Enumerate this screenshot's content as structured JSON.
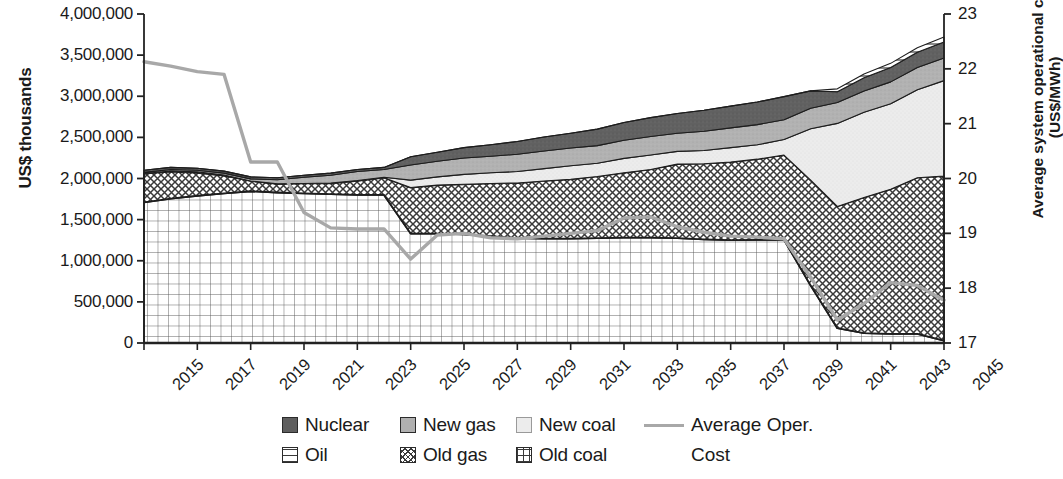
{
  "chart_data": {
    "type": "area",
    "title": "",
    "xlabel": "",
    "ylabel": "US$ thousands",
    "y2label": "Average system operational cost (US$/MWh)",
    "grid": false,
    "legend_position": "bottom",
    "x": [
      2015,
      2016,
      2017,
      2018,
      2019,
      2020,
      2021,
      2022,
      2023,
      2024,
      2025,
      2026,
      2027,
      2028,
      2029,
      2030,
      2031,
      2032,
      2033,
      2034,
      2035,
      2036,
      2037,
      2038,
      2039,
      2040,
      2041,
      2042,
      2043,
      2044,
      2045
    ],
    "xtick_labels": [
      "2015",
      "2017",
      "2019",
      "2021",
      "2023",
      "2025",
      "2027",
      "2029",
      "2031",
      "2033",
      "2035",
      "2037",
      "2039",
      "2041",
      "2043",
      "2045"
    ],
    "ylim": [
      0,
      4000000
    ],
    "ytick_labels": [
      "0",
      "500,000",
      "1,000,000",
      "1,500,000",
      "2,000,000",
      "2,500,000",
      "3,000,000",
      "3,500,000",
      "4,000,000"
    ],
    "ytick_values": [
      0,
      500000,
      1000000,
      1500000,
      2000000,
      2500000,
      3000000,
      3500000,
      4000000
    ],
    "y2lim": [
      17,
      23
    ],
    "y2tick_labels": [
      "17",
      "18",
      "19",
      "20",
      "21",
      "22",
      "23"
    ],
    "y2tick_values": [
      17,
      18,
      19,
      20,
      21,
      22,
      23
    ],
    "stack_order": [
      "Old coal",
      "Old gas",
      "New coal",
      "New gas",
      "Nuclear",
      "Oil"
    ],
    "series": [
      {
        "name": "Old coal",
        "pattern": "grid",
        "fill": "#ffffff",
        "values": [
          1710000,
          1755000,
          1790000,
          1820000,
          1845000,
          1830000,
          1820000,
          1810000,
          1800000,
          1800000,
          1330000,
          1330000,
          1320000,
          1300000,
          1275000,
          1270000,
          1270000,
          1275000,
          1280000,
          1280000,
          1275000,
          1260000,
          1250000,
          1255000,
          1255000,
          700000,
          180000,
          120000,
          110000,
          110000,
          30000
        ]
      },
      {
        "name": "Old gas",
        "pattern": "crosshatch",
        "fill": "#ffffff",
        "values": [
          350000,
          330000,
          280000,
          215000,
          125000,
          105000,
          120000,
          130000,
          170000,
          210000,
          560000,
          590000,
          610000,
          640000,
          670000,
          700000,
          720000,
          750000,
          790000,
          830000,
          900000,
          920000,
          950000,
          980000,
          1030000,
          1280000,
          1480000,
          1650000,
          1760000,
          1900000,
          2000000
        ]
      },
      {
        "name": "New coal",
        "pattern": "solid",
        "fill": "#ececec",
        "values": [
          0,
          0,
          0,
          0,
          0,
          0,
          0,
          0,
          0,
          0,
          0,
          0,
          0,
          0,
          0,
          0,
          0,
          0,
          0,
          0,
          0,
          0,
          0,
          0,
          0,
          0,
          0,
          0,
          0,
          0,
          0
        ]
      },
      {
        "name": "New gas",
        "pattern": "solid",
        "fill": "#b0b0b0",
        "values": [
          15000,
          18000,
          20000,
          22000,
          25000,
          50000,
          75000,
          95000,
          110000,
          95000,
          185000,
          190000,
          200000,
          200000,
          210000,
          215000,
          215000,
          215000,
          220000,
          225000,
          220000,
          235000,
          240000,
          245000,
          240000,
          250000,
          255000,
          260000,
          265000,
          270000,
          275000
        ]
      },
      {
        "name": "Nuclear",
        "pattern": "solid",
        "fill": "#5e5e5e",
        "values": [
          25000,
          25000,
          25000,
          25000,
          25000,
          25000,
          25000,
          25000,
          25000,
          25000,
          100000,
          110000,
          125000,
          140000,
          155000,
          170000,
          180000,
          200000,
          215000,
          230000,
          240000,
          255000,
          265000,
          275000,
          280000,
          210000,
          130000,
          160000,
          175000,
          185000,
          195000
        ]
      },
      {
        "name": "Oil",
        "pattern": "hlines",
        "fill": "#ffffff",
        "values": [
          0,
          0,
          0,
          0,
          0,
          0,
          0,
          0,
          0,
          0,
          0,
          0,
          0,
          0,
          0,
          0,
          0,
          0,
          0,
          0,
          0,
          0,
          0,
          0,
          0,
          0,
          35000,
          45000,
          50000,
          55000,
          60000
        ]
      }
    ],
    "line_series": {
      "name": "Average Oper. Cost",
      "axis": "right",
      "color": "#a8a8a8",
      "values": [
        22.13,
        22.05,
        21.95,
        21.9,
        20.3,
        20.3,
        19.38,
        19.1,
        19.08,
        19.08,
        18.53,
        18.97,
        19.0,
        18.92,
        18.9,
        18.95,
        19.0,
        19.05,
        19.28,
        19.3,
        19.12,
        19.02,
        18.95,
        18.93,
        18.9,
        18.2,
        17.42,
        17.72,
        18.1,
        18.05,
        17.78
      ]
    }
  },
  "axis": {
    "left_title": "US$ thousands",
    "right_title_line1": "Average system operational cost",
    "right_title_line2": "(US$/MWh)"
  },
  "legend": {
    "items": [
      {
        "label": "Nuclear",
        "swatch": "nuclear-swatch"
      },
      {
        "label": "New gas",
        "swatch": "new-gas-swatch"
      },
      {
        "label": "New coal",
        "swatch": "new-coal-swatch"
      },
      {
        "label": "Oil",
        "swatch": "oil-swatch"
      },
      {
        "label": "Old gas",
        "swatch": "old-gas-swatch"
      },
      {
        "label": "Old coal",
        "swatch": "old-coal-swatch"
      }
    ],
    "cost_label_line1": "Average Oper.",
    "cost_label_line2": "Cost"
  },
  "colors": {
    "nuclear": "#5e5e5e",
    "new_gas": "#b0b0b0",
    "new_coal": "#ececec",
    "cost_line": "#a8a8a8",
    "axis": "#222222"
  }
}
